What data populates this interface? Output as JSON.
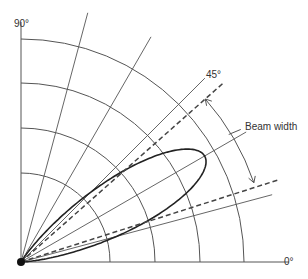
{
  "diagram": {
    "title": "",
    "type": "polar-radiation-pattern",
    "origin": [
      21,
      262
    ],
    "ring_radii": [
      89,
      134,
      179,
      223
    ],
    "axis_length_x": 268,
    "axis_length_y": 222,
    "radial_lines": [
      {
        "angle": 15,
        "length": 260
      },
      {
        "angle": 30,
        "length": 260
      },
      {
        "angle": 45,
        "length": 260
      },
      {
        "angle": 60,
        "length": 260
      },
      {
        "angle": 75,
        "length": 258
      }
    ],
    "beam_lobe": {
      "axis_angle": 30,
      "max_radius": 212,
      "half_angle": 12
    },
    "beam_edges": [
      {
        "angle": 41.5,
        "length": 269
      },
      {
        "angle": 17.7,
        "length": 270
      }
    ],
    "beam_width_arrow": {
      "radius": 246,
      "start_angle": 41.5,
      "end_angle": 18.8
    },
    "colors": {
      "grid": "#555555",
      "lobe": "#222222",
      "dashed": "#444444",
      "text": "#333333"
    }
  },
  "labels": {
    "angle_90": "90°",
    "angle_45": "45°",
    "angle_0": "0°",
    "beam_width": "Beam width"
  }
}
